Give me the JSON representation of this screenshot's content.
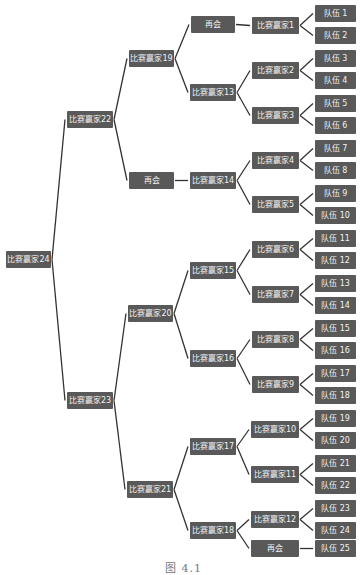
{
  "diagram": {
    "type": "tournament-bracket",
    "box_color": "#595959",
    "text_color": "#f2f2f2",
    "line_color": "#333333",
    "caption": "图 4.1",
    "nodes": [
      {
        "id": "w24",
        "label": "比赛赢家24",
        "x": 6,
        "y": 251,
        "w": 45
      },
      {
        "id": "w22",
        "label": "比赛赢家22",
        "x": 67,
        "y": 111,
        "w": 46
      },
      {
        "id": "w23",
        "label": "比赛赢家23",
        "x": 67,
        "y": 392,
        "w": 46
      },
      {
        "id": "w19",
        "label": "比赛赢家19",
        "x": 129,
        "y": 50,
        "w": 45
      },
      {
        "id": "bye1",
        "label": "再会",
        "x": 129,
        "y": 172,
        "w": 45
      },
      {
        "id": "w20",
        "label": "比赛赢家20",
        "x": 128,
        "y": 305,
        "w": 45
      },
      {
        "id": "w21",
        "label": "比赛赢家21",
        "x": 127,
        "y": 481,
        "w": 46
      },
      {
        "id": "bye2",
        "label": "再会",
        "x": 191,
        "y": 16,
        "w": 44
      },
      {
        "id": "w13",
        "label": "比赛赢家13",
        "x": 190,
        "y": 84,
        "w": 46
      },
      {
        "id": "w14",
        "label": "比赛赢家14",
        "x": 190,
        "y": 172,
        "w": 46
      },
      {
        "id": "w15",
        "label": "比赛赢家15",
        "x": 190,
        "y": 262,
        "w": 46
      },
      {
        "id": "w16",
        "label": "比赛赢家16",
        "x": 190,
        "y": 350,
        "w": 46
      },
      {
        "id": "w17",
        "label": "比赛赢家17",
        "x": 190,
        "y": 438,
        "w": 46
      },
      {
        "id": "w18",
        "label": "比赛赢家18",
        "x": 190,
        "y": 522,
        "w": 46
      },
      {
        "id": "w1",
        "label": "比赛赢家1",
        "x": 252,
        "y": 17,
        "w": 47
      },
      {
        "id": "w2",
        "label": "比赛赢家2",
        "x": 252,
        "y": 62,
        "w": 47
      },
      {
        "id": "w3",
        "label": "比赛赢家3",
        "x": 252,
        "y": 107,
        "w": 47
      },
      {
        "id": "w4",
        "label": "比赛赢家4",
        "x": 252,
        "y": 152,
        "w": 47
      },
      {
        "id": "w5",
        "label": "比赛赢家5",
        "x": 252,
        "y": 196,
        "w": 47
      },
      {
        "id": "w6",
        "label": "比赛赢家6",
        "x": 252,
        "y": 241,
        "w": 47
      },
      {
        "id": "w7",
        "label": "比赛赢家7",
        "x": 252,
        "y": 286,
        "w": 47
      },
      {
        "id": "w8",
        "label": "比赛赢家8",
        "x": 252,
        "y": 331,
        "w": 47
      },
      {
        "id": "w9",
        "label": "比赛赢家9",
        "x": 252,
        "y": 376,
        "w": 47
      },
      {
        "id": "w10",
        "label": "比赛赢家10",
        "x": 251,
        "y": 421,
        "w": 48
      },
      {
        "id": "w11",
        "label": "比赛赢家11",
        "x": 251,
        "y": 466,
        "w": 48
      },
      {
        "id": "w12",
        "label": "比赛赢家12",
        "x": 251,
        "y": 511,
        "w": 48
      },
      {
        "id": "bye3",
        "label": "再会",
        "x": 251,
        "y": 540,
        "w": 48
      },
      {
        "id": "t1",
        "label": "队伍 1",
        "x": 315,
        "y": 5,
        "w": 41
      },
      {
        "id": "t2",
        "label": "队伍 2",
        "x": 315,
        "y": 27,
        "w": 41
      },
      {
        "id": "t3",
        "label": "队伍 3",
        "x": 315,
        "y": 50,
        "w": 41
      },
      {
        "id": "t4",
        "label": "队伍 4",
        "x": 315,
        "y": 72,
        "w": 41
      },
      {
        "id": "t5",
        "label": "队伍 5",
        "x": 315,
        "y": 95,
        "w": 41
      },
      {
        "id": "t6",
        "label": "队伍 6",
        "x": 315,
        "y": 117,
        "w": 41
      },
      {
        "id": "t7",
        "label": "队伍 7",
        "x": 315,
        "y": 140,
        "w": 41
      },
      {
        "id": "t8",
        "label": "队伍 8",
        "x": 315,
        "y": 162,
        "w": 41
      },
      {
        "id": "t9",
        "label": "队伍 9",
        "x": 315,
        "y": 185,
        "w": 41
      },
      {
        "id": "t10",
        "label": "队伍 10",
        "x": 315,
        "y": 207,
        "w": 41
      },
      {
        "id": "t11",
        "label": "队伍 11",
        "x": 315,
        "y": 230,
        "w": 41
      },
      {
        "id": "t12",
        "label": "队伍 12",
        "x": 315,
        "y": 252,
        "w": 41
      },
      {
        "id": "t13",
        "label": "队伍 13",
        "x": 315,
        "y": 275,
        "w": 41
      },
      {
        "id": "t14",
        "label": "队伍 14",
        "x": 315,
        "y": 297,
        "w": 41
      },
      {
        "id": "t15",
        "label": "队伍 15",
        "x": 315,
        "y": 320,
        "w": 41
      },
      {
        "id": "t16",
        "label": "队伍 16",
        "x": 315,
        "y": 342,
        "w": 41
      },
      {
        "id": "t17",
        "label": "队伍 17",
        "x": 315,
        "y": 365,
        "w": 41
      },
      {
        "id": "t18",
        "label": "队伍 18",
        "x": 315,
        "y": 387,
        "w": 41
      },
      {
        "id": "t19",
        "label": "队伍 19",
        "x": 315,
        "y": 410,
        "w": 41
      },
      {
        "id": "t20",
        "label": "队伍 20",
        "x": 315,
        "y": 432,
        "w": 41
      },
      {
        "id": "t21",
        "label": "队伍 21",
        "x": 315,
        "y": 455,
        "w": 41
      },
      {
        "id": "t22",
        "label": "队伍 22",
        "x": 315,
        "y": 477,
        "w": 41
      },
      {
        "id": "t23",
        "label": "队伍 23",
        "x": 315,
        "y": 500,
        "w": 41
      },
      {
        "id": "t24",
        "label": "队伍 24",
        "x": 315,
        "y": 522,
        "w": 41
      },
      {
        "id": "t25",
        "label": "队伍 25",
        "x": 315,
        "y": 540,
        "w": 41
      }
    ],
    "edges": [
      [
        "w24",
        "w22"
      ],
      [
        "w24",
        "w23"
      ],
      [
        "w22",
        "w19"
      ],
      [
        "w22",
        "bye1"
      ],
      [
        "w23",
        "w20"
      ],
      [
        "w23",
        "w21"
      ],
      [
        "w19",
        "bye2"
      ],
      [
        "w19",
        "w13"
      ],
      [
        "bye1",
        "w14"
      ],
      [
        "w20",
        "w15"
      ],
      [
        "w20",
        "w16"
      ],
      [
        "w21",
        "w17"
      ],
      [
        "w21",
        "w18"
      ],
      [
        "bye2",
        "w1"
      ],
      [
        "w13",
        "w2"
      ],
      [
        "w13",
        "w3"
      ],
      [
        "w14",
        "w4"
      ],
      [
        "w14",
        "w5"
      ],
      [
        "w15",
        "w6"
      ],
      [
        "w15",
        "w7"
      ],
      [
        "w16",
        "w8"
      ],
      [
        "w16",
        "w9"
      ],
      [
        "w17",
        "w10"
      ],
      [
        "w17",
        "w11"
      ],
      [
        "w18",
        "w12"
      ],
      [
        "w18",
        "bye3"
      ],
      [
        "w1",
        "t1"
      ],
      [
        "w1",
        "t2"
      ],
      [
        "w2",
        "t3"
      ],
      [
        "w2",
        "t4"
      ],
      [
        "w3",
        "t5"
      ],
      [
        "w3",
        "t6"
      ],
      [
        "w4",
        "t7"
      ],
      [
        "w4",
        "t8"
      ],
      [
        "w5",
        "t9"
      ],
      [
        "w5",
        "t10"
      ],
      [
        "w6",
        "t11"
      ],
      [
        "w6",
        "t12"
      ],
      [
        "w7",
        "t13"
      ],
      [
        "w7",
        "t14"
      ],
      [
        "w8",
        "t15"
      ],
      [
        "w8",
        "t16"
      ],
      [
        "w9",
        "t17"
      ],
      [
        "w9",
        "t18"
      ],
      [
        "w10",
        "t19"
      ],
      [
        "w10",
        "t20"
      ],
      [
        "w11",
        "t21"
      ],
      [
        "w11",
        "t22"
      ],
      [
        "w12",
        "t23"
      ],
      [
        "w12",
        "t24"
      ],
      [
        "bye3",
        "t25"
      ]
    ]
  }
}
